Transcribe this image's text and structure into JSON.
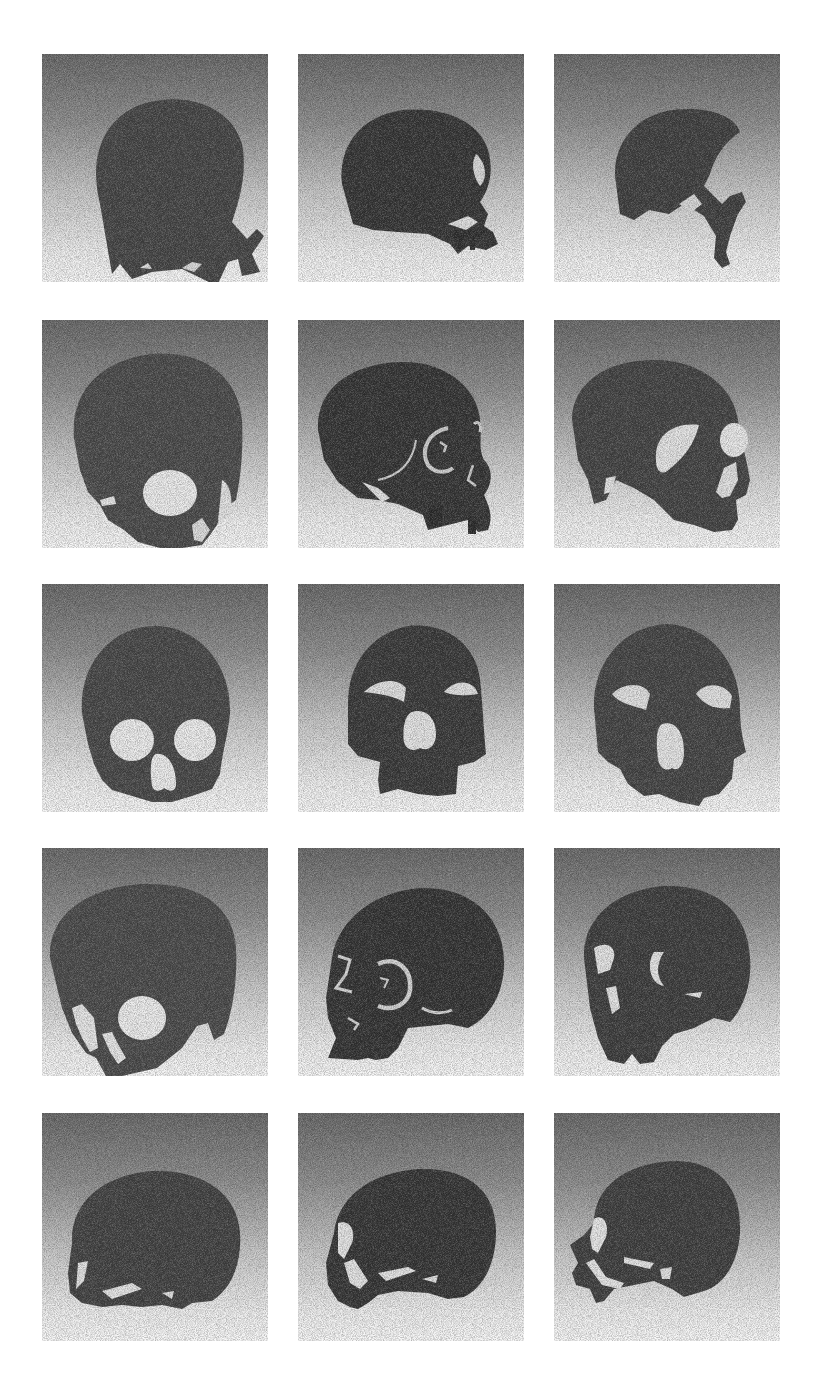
{
  "figure": {
    "type": "image-grid",
    "rows": 5,
    "columns": 3,
    "background_gradient": {
      "top": "#666666",
      "bottom": "#f7f7f7"
    },
    "skull_color": "#3c3c3c",
    "highlight_color": "#d9d9d9",
    "panels": [
      {
        "row": 1,
        "col": 1,
        "view": "posterior-lateral oblique, cranial vault with partial face"
      },
      {
        "row": 1,
        "col": 2,
        "view": "right lateral, partial maxilla"
      },
      {
        "row": 1,
        "col": 3,
        "view": "right lateral oblique, fragmentary face"
      },
      {
        "row": 2,
        "col": 1,
        "view": "left anterior oblique, orbit visible"
      },
      {
        "row": 2,
        "col": 2,
        "view": "right lateral, orbit ring and zygoma"
      },
      {
        "row": 2,
        "col": 3,
        "view": "right anterior oblique, orbits and nasal aperture"
      },
      {
        "row": 3,
        "col": 1,
        "view": "frontal, orbits and nasal aperture"
      },
      {
        "row": 3,
        "col": 2,
        "view": "frontal, orbits and nasal aperture with maxilla"
      },
      {
        "row": 3,
        "col": 3,
        "view": "frontal, orbits, nasal aperture and maxilla"
      },
      {
        "row": 4,
        "col": 1,
        "view": "left anterior oblique, orbit visible"
      },
      {
        "row": 4,
        "col": 2,
        "view": "left lateral, orbit ring"
      },
      {
        "row": 4,
        "col": 3,
        "view": "left anterior oblique, orbits"
      },
      {
        "row": 5,
        "col": 1,
        "view": "left lateral, cranial vault"
      },
      {
        "row": 5,
        "col": 2,
        "view": "left lateral, partial face"
      },
      {
        "row": 5,
        "col": 3,
        "view": "left lateral, partial face and zygomatic arch"
      }
    ]
  },
  "caption": {
    "text": ""
  }
}
